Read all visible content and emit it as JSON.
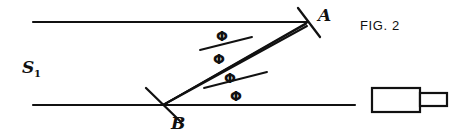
{
  "figure": {
    "caption": "FIG. 2",
    "caption_pos": {
      "x": 360,
      "y": 27
    },
    "background": "#ffffff",
    "ink_color": "#111111",
    "width": 452,
    "height": 137
  },
  "labels": {
    "source": {
      "text": "S",
      "subscript": "1",
      "x": 22,
      "y": 68
    },
    "point_a": {
      "text": "A",
      "x": 318,
      "y": 16
    },
    "point_b": {
      "text": "B",
      "x": 171,
      "y": 124
    }
  },
  "points": {
    "a": {
      "x": 308,
      "y": 22,
      "name": "mirror-a"
    },
    "b": {
      "x": 163,
      "y": 105,
      "name": "mirror-b"
    }
  },
  "beam_axes": [
    {
      "name": "upper-beam-axis",
      "x1": 33,
      "y1": 22,
      "x2": 308,
      "y2": 22
    },
    {
      "name": "lower-beam-axis",
      "x1": 33,
      "y1": 105,
      "x2": 355,
      "y2": 105
    }
  ],
  "rays": [
    {
      "name": "ray-upper-a-to-b",
      "x1": 308,
      "y1": 22,
      "x2": 163,
      "y2": 105
    },
    {
      "name": "ray-middle-a-to-b",
      "x1": 308,
      "y1": 24,
      "x2": 163,
      "y2": 105
    },
    {
      "name": "ray-lower-b-to-right",
      "x1": 163,
      "y1": 105,
      "x2": 308,
      "y2": 26
    }
  ],
  "mirror_ticks": [
    {
      "name": "mirror-tick-a",
      "x1": 298,
      "y1": 8,
      "x2": 320,
      "y2": 37
    },
    {
      "name": "mirror-tick-b",
      "x1": 146,
      "y1": 88,
      "x2": 181,
      "y2": 122
    }
  ],
  "bisectors": [
    {
      "name": "angle-bisector-upper",
      "x1": 200,
      "y1": 50,
      "x2": 252,
      "y2": 37
    },
    {
      "name": "angle-bisector-lower",
      "x1": 204,
      "y1": 88,
      "x2": 267,
      "y2": 72
    }
  ],
  "angle_labels": [
    {
      "name": "phi-upper-above",
      "text": "Φ",
      "x": 222,
      "y": 37
    },
    {
      "name": "phi-upper-below",
      "text": "Φ",
      "x": 219,
      "y": 60
    },
    {
      "name": "phi-lower-above",
      "text": "Φ",
      "x": 230,
      "y": 79
    },
    {
      "name": "phi-lower-below",
      "text": "Φ",
      "x": 236,
      "y": 97
    }
  ],
  "device": {
    "name": "detector-assembly",
    "body": {
      "x": 372,
      "y": 88,
      "width": 48,
      "height": 24
    },
    "nozzle": {
      "x": 420,
      "y": 93,
      "width": 27,
      "height": 13
    }
  }
}
